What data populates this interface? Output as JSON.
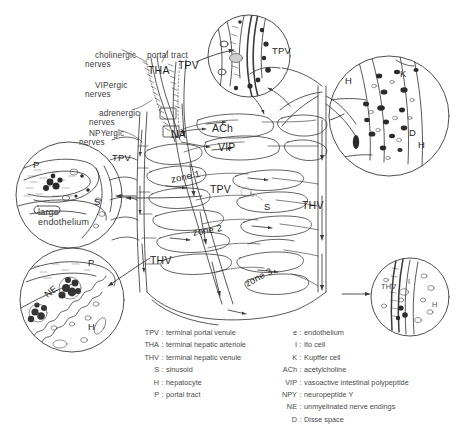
{
  "figure": {
    "kind": "hepatic-microcirculation-innervation-diagram",
    "background": "#ffffff",
    "ink": "#3a3a3a"
  },
  "nerve_labels": [
    {
      "id": "cholinergic",
      "text": "cholinergic\nnerves",
      "x": 85,
      "y": 46
    },
    {
      "id": "portal-tract",
      "text": "portal tract",
      "x": 137,
      "y": 46
    },
    {
      "id": "vipergic",
      "text": "VIPergic\nnerves",
      "x": 85,
      "y": 76
    },
    {
      "id": "adrenergic",
      "text": "adrenergic\nnerves",
      "x": 89,
      "y": 104
    },
    {
      "id": "npyergic",
      "text": "NPYergic\nnerves",
      "x": 79,
      "y": 124
    }
  ],
  "structure_labels": [
    {
      "id": "tha",
      "text": "THA",
      "x": 148,
      "y": 71,
      "cls": "big"
    },
    {
      "id": "tpv-top",
      "text": "TPV",
      "x": 178,
      "y": 66,
      "cls": "big"
    },
    {
      "id": "na",
      "text": "NA",
      "x": 171,
      "y": 135,
      "cls": "big"
    },
    {
      "id": "ach",
      "text": "ACh",
      "x": 212,
      "y": 129,
      "cls": "big"
    },
    {
      "id": "vip",
      "text": "VIP",
      "x": 218,
      "y": 148,
      "cls": "big"
    },
    {
      "id": "tpv-mid",
      "text": "TPV",
      "x": 210,
      "y": 190,
      "cls": "big"
    },
    {
      "id": "thv-right",
      "text": "THV",
      "x": 302,
      "y": 206,
      "cls": "big"
    },
    {
      "id": "thv-left",
      "text": "THV",
      "x": 150,
      "y": 261,
      "cls": "big"
    },
    {
      "id": "s-center",
      "text": "S",
      "x": 264,
      "y": 207,
      "cls": "mid"
    },
    {
      "id": "tpv-inset-left",
      "text": "TPV",
      "x": 112,
      "y": 159,
      "cls": "mid"
    }
  ],
  "zone_labels": [
    {
      "id": "zone-1",
      "text": "zone 1",
      "x": 170,
      "y": 180,
      "rot": -12
    },
    {
      "id": "zone-2",
      "text": "zone 2",
      "x": 192,
      "y": 233,
      "rot": -10
    },
    {
      "id": "zone-3",
      "text": "zone 3",
      "x": 243,
      "y": 285,
      "rot": -28
    }
  ],
  "inset_top": {
    "name": "portal-venule-inset",
    "labels": [
      {
        "text": "TPV",
        "x": 272,
        "y": 51
      }
    ]
  },
  "inset_right": {
    "name": "sinusoid-cells-inset",
    "labels": [
      {
        "text": "H",
        "x": 345,
        "y": 81
      },
      {
        "text": "K",
        "x": 400,
        "y": 74
      },
      {
        "text": "D",
        "x": 409,
        "y": 133
      },
      {
        "text": "H",
        "x": 418,
        "y": 145
      }
    ]
  },
  "inset_left": {
    "name": "large-endothelium-inset",
    "labels": [
      {
        "text": "P",
        "x": 33,
        "y": 165
      },
      {
        "text": "S",
        "x": 94,
        "y": 202
      },
      {
        "text": "large",
        "x": 38,
        "y": 213
      },
      {
        "text": "endothelium",
        "x": 38,
        "y": 222
      }
    ]
  },
  "inset_bottom_left": {
    "name": "unmyelinated-nerve-endings-inset",
    "labels": [
      {
        "text": "P",
        "x": 88,
        "y": 263
      },
      {
        "text": "NE",
        "x": 42,
        "y": 297
      },
      {
        "text": "H",
        "x": 88,
        "y": 327
      }
    ]
  },
  "inset_bottom_right": {
    "name": "terminal-hepatic-venule-inset",
    "labels": [
      {
        "text": "THV",
        "x": 381,
        "y": 288
      },
      {
        "text": "I",
        "x": 408,
        "y": 283
      },
      {
        "text": "H",
        "x": 432,
        "y": 306
      }
    ]
  },
  "legend": {
    "left": [
      {
        "abbr": "TPV",
        "def": "terminal portal venule"
      },
      {
        "abbr": "THA",
        "def": "terminal hepatic arteriole"
      },
      {
        "abbr": "THV",
        "def": "terminal hepatic venule"
      },
      {
        "abbr": "S",
        "def": "sinusoid"
      },
      {
        "abbr": "H",
        "def": "hepatocyte"
      },
      {
        "abbr": "P",
        "def": "portal tract"
      }
    ],
    "right": [
      {
        "abbr": "e",
        "def": "endothelium"
      },
      {
        "abbr": "I",
        "def": "Ito cell"
      },
      {
        "abbr": "K",
        "def": "Kupffer cell"
      },
      {
        "abbr": "ACh",
        "def": "acetylcholine"
      },
      {
        "abbr": "VIP",
        "def": "vasoactive intestinal polypeptide"
      },
      {
        "abbr": "NPY",
        "def": "neuropeptide Y"
      },
      {
        "abbr": "NE",
        "def": "unmyelinated nerve endings"
      },
      {
        "abbr": "D",
        "def": "Disse space"
      }
    ],
    "separator": ":"
  }
}
